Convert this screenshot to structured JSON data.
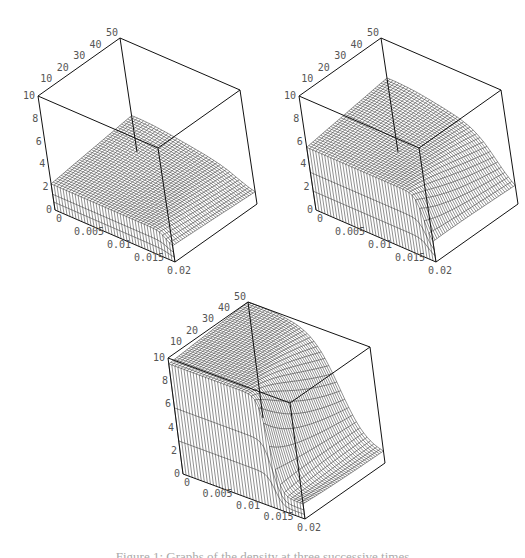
{
  "figure": {
    "caption": "Figure 1: Graphs of the density at three successive times"
  },
  "chart_data": [
    {
      "type": "surface3d",
      "title": "",
      "x_axis": {
        "range": [
          0,
          0.02
        ],
        "ticks": [
          "0",
          "0.005",
          "0.01",
          "0.015",
          "0.02"
        ]
      },
      "y_axis": {
        "range": [
          0,
          50
        ],
        "ticks": [
          "10",
          "20",
          "30",
          "40",
          "50"
        ]
      },
      "z_axis": {
        "range": [
          0,
          10
        ],
        "ticks": [
          "0",
          "2",
          "4",
          "6",
          "8",
          "10"
        ]
      },
      "surface": {
        "plateau_height": 2.3,
        "front_drop_x": 0.019,
        "back_bump_height": 3.2,
        "description": "low flat plateau ~2.3 with slight rise toward back corner"
      },
      "box": {
        "tl": [
          38,
          96
        ],
        "tb": [
          120,
          38
        ],
        "tr": [
          240,
          67
        ],
        "tf": [
          181,
          141
        ],
        "bl": [
          55,
          210
        ],
        "bf": [
          175,
          262
        ],
        "br": [
          225,
          174
        ]
      }
    },
    {
      "type": "surface3d",
      "title": "",
      "x_axis": {
        "range": [
          0,
          0.02
        ],
        "ticks": [
          "0",
          "0.005",
          "0.01",
          "0.015",
          "0.02"
        ]
      },
      "y_axis": {
        "range": [
          0,
          50
        ],
        "ticks": [
          "10",
          "20",
          "30",
          "40",
          "50"
        ]
      },
      "z_axis": {
        "range": [
          0,
          10
        ],
        "ticks": [
          "0",
          "2",
          "4",
          "6",
          "8",
          "10"
        ]
      },
      "surface": {
        "plateau_height": 5.5,
        "front_drop_x": 0.019,
        "back_bump_height": 6.5,
        "description": "plateau ~5.5 at small x, ridge rising to ~6.5 at back, falls off to ~1.5 near x=0.02"
      },
      "box": {
        "tl": [
          299,
          96
        ],
        "tb": [
          381,
          38
        ],
        "tr": [
          501,
          67
        ],
        "tf": [
          442,
          141
        ],
        "bl": [
          316,
          210
        ],
        "bf": [
          436,
          262
        ],
        "br": [
          486,
          174
        ]
      }
    },
    {
      "type": "surface3d",
      "title": "",
      "x_axis": {
        "range": [
          0,
          0.02
        ],
        "ticks": [
          "0",
          "0.005",
          "0.01",
          "0.015",
          "0.02"
        ]
      },
      "y_axis": {
        "range": [
          0,
          50
        ],
        "ticks": [
          "10",
          "20",
          "30",
          "40",
          "50"
        ]
      },
      "z_axis": {
        "range": [
          0,
          10
        ],
        "ticks": [
          "0",
          "2",
          "4",
          "6",
          "8",
          "10"
        ]
      },
      "surface": {
        "plateau_height": 9.5,
        "front_drop_x": 0.0155,
        "back_bump_height": 10,
        "description": "high plateau ~9.5 reaching box top, sharp drop near x=0.016 to ~1 beyond"
      },
      "box": {
        "tl": [
          168,
          358
        ],
        "tb": [
          248,
          302
        ],
        "tr": [
          370,
          330
        ],
        "tf": [
          310,
          405
        ],
        "bl": [
          183,
          474
        ],
        "bf": [
          305,
          519
        ],
        "br": [
          355,
          440
        ]
      }
    }
  ]
}
